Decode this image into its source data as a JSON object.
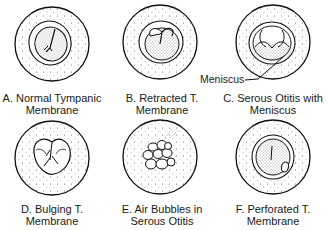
{
  "figure": {
    "panels": [
      {
        "id": "A",
        "line1": "A. Normal Tympanic",
        "line2": "Membrane"
      },
      {
        "id": "B",
        "line1": "B. Retracted T.",
        "line2": "Membrane"
      },
      {
        "id": "C",
        "line1": "C. Serous Otitis with",
        "line2": "Meniscus"
      },
      {
        "id": "D",
        "line1": "D. Bulging T.",
        "line2": "Membrane"
      },
      {
        "id": "E",
        "line1": "E. Air Bubbles in",
        "line2": "Serous Otitis"
      },
      {
        "id": "F",
        "line1": "F. Perforated T.",
        "line2": "Membrane"
      }
    ],
    "callout": {
      "label": "Meniscus"
    }
  }
}
